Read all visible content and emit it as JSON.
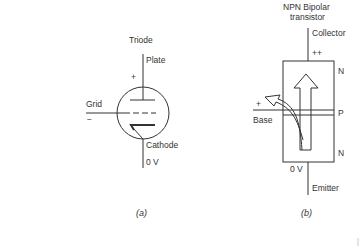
{
  "figure_a": {
    "title": "Triode",
    "labels": {
      "plate": "Plate",
      "plate_polarity": "+",
      "grid": "Grid",
      "grid_polarity": "−",
      "cathode": "Cathode",
      "cathode_voltage": "0 V"
    },
    "caption": "(a)"
  },
  "figure_b": {
    "title_line1": "NPN Bipolar",
    "title_line2": "transistor",
    "labels": {
      "collector": "Collector",
      "collector_polarity": "++",
      "region_top": "N",
      "base_polarity": "+",
      "base": "Base",
      "region_middle": "P",
      "region_bottom": "N",
      "emitter_voltage": "0 V",
      "emitter": "Emitter"
    },
    "caption": "(b)"
  },
  "colors": {
    "ink": "#333333",
    "background": "#ffffff"
  }
}
